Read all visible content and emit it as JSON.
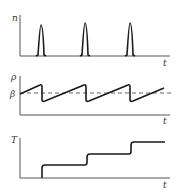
{
  "panels": [
    {
      "id": "neutron-density",
      "y_label": "n",
      "x_label": "t",
      "description": "Periodic sharp pulses",
      "pulse_positions_x": [
        42,
        86,
        130
      ]
    },
    {
      "id": "reactivity",
      "y_label": "ρ",
      "x_label": "t",
      "reference_label": "β",
      "description": "Sawtooth oscillating around dashed β level"
    },
    {
      "id": "temperature",
      "y_label": "T",
      "x_label": "t",
      "description": "Staircase rising at each pulse"
    }
  ],
  "colors": {
    "line": "#1a1a1a",
    "axis": "#555555",
    "dashed": "#555555",
    "background": "#ffffff"
  }
}
